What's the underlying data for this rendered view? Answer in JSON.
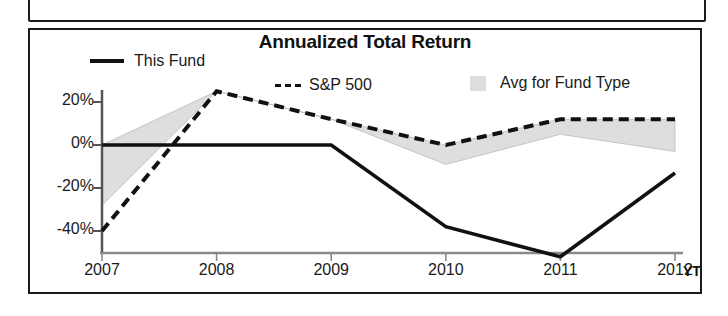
{
  "chart": {
    "title": "Annualized Total Return",
    "ytd_suffix": "YTD",
    "legend": [
      {
        "label": "This Fund",
        "marker": "solid-line-swatch"
      },
      {
        "label": "S&P 500",
        "marker": "dashed-line-swatch"
      },
      {
        "label": "Avg for Fund Type",
        "marker": "shaded-area-swatch"
      }
    ],
    "colors": {
      "line_this_fund": "#111111",
      "line_sp500": "#111111",
      "area_avg_fund_type": "#dedede",
      "area_stroke": "#c8c8c8",
      "axis": "#555555",
      "frame": "#1c1c1c"
    }
  },
  "chart_data": {
    "type": "line",
    "title": "Annualized Total Return",
    "xlabel": "",
    "ylabel": "",
    "x": [
      "2007",
      "2008",
      "2009",
      "2010",
      "2011",
      "2012"
    ],
    "categories": [
      "2007",
      "2008",
      "2009",
      "2010",
      "2011",
      "2012"
    ],
    "yticks": [
      "20%",
      "0%",
      "-20%",
      "-40%"
    ],
    "ytick_values": [
      20,
      0,
      -20,
      -40
    ],
    "ylim": [
      -55,
      30
    ],
    "grid": false,
    "legend_position": "top",
    "series": [
      {
        "name": "This Fund",
        "style": "solid",
        "values": [
          0,
          0,
          0,
          -38,
          -52,
          -13
        ]
      },
      {
        "name": "S&P 500",
        "style": "dashed",
        "values": [
          -40,
          25,
          12,
          0,
          12,
          12
        ]
      },
      {
        "name": "Avg for Fund Type",
        "style": "area",
        "values": [
          -28,
          25,
          12,
          -9,
          5,
          -3
        ]
      }
    ],
    "annotations": [
      "YTD"
    ]
  }
}
